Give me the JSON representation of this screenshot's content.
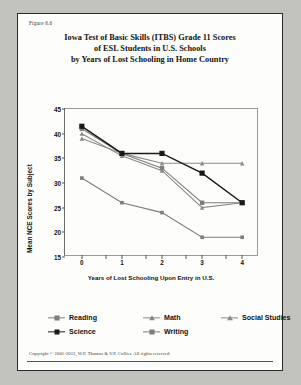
{
  "figure_label": "Figure 6.6",
  "title_lines": [
    "Iowa Test of Basic Skills (ITBS) Grade 11 Scores",
    "of ESL Students in U.S. Schools",
    "by Years of Lost Schooling in Home Country"
  ],
  "copyright": "Copyright © 2001-2012, W.P. Thomas & V.P. Collier.  All rights reserved.",
  "legend_items": [
    {
      "label": "Reading",
      "marker": "square",
      "color": "#7d7d7d"
    },
    {
      "label": "Math",
      "marker": "triangle",
      "color": "#8a8a8a"
    },
    {
      "label": "Social Studies",
      "marker": "triangle",
      "color": "#8a8a8a"
    },
    {
      "label": "Science",
      "marker": "square",
      "color": "#1a1a1a"
    },
    {
      "label": "Writing",
      "marker": "square",
      "color": "#7d7d7d"
    }
  ],
  "chart_data": {
    "type": "line",
    "title": "Iowa Test of Basic Skills (ITBS) Grade 11 Scores of ESL Students in U.S. Schools by Years of Lost Schooling in Home Country",
    "xlabel": "Years of Lost Schooling Upon Entry in U.S.",
    "ylabel": "Mean NCE Scores by Subject",
    "x": [
      0,
      1,
      2,
      3,
      4
    ],
    "xticklabels": [
      "0",
      "1",
      "2",
      "3",
      "4"
    ],
    "yticklabels": [
      "15",
      "20",
      "25",
      "30",
      "35",
      "40",
      "45"
    ],
    "xlim": [
      -0.42,
      4.42
    ],
    "ylim": [
      15,
      45
    ],
    "ytick_step": 5,
    "grid": false,
    "legend_position": "bottom",
    "series": [
      {
        "name": "Reading",
        "marker": "square",
        "color": "#7d7d7d",
        "values": [
          41,
          36,
          33,
          26,
          26
        ]
      },
      {
        "name": "Math",
        "marker": "triangle",
        "color": "#8a8a8a",
        "values": [
          40,
          35.5,
          32.5,
          25,
          26
        ]
      },
      {
        "name": "Social Studies",
        "marker": "triangle",
        "color": "#8a8a8a",
        "values": [
          39,
          36,
          34,
          34,
          34
        ]
      },
      {
        "name": "Science",
        "marker": "square",
        "color": "#1a1a1a",
        "values": [
          41.5,
          36,
          36,
          32,
          26
        ]
      },
      {
        "name": "Writing",
        "marker": "square",
        "color": "#7d7d7d",
        "values": [
          31,
          26,
          24,
          19,
          19
        ]
      }
    ]
  }
}
